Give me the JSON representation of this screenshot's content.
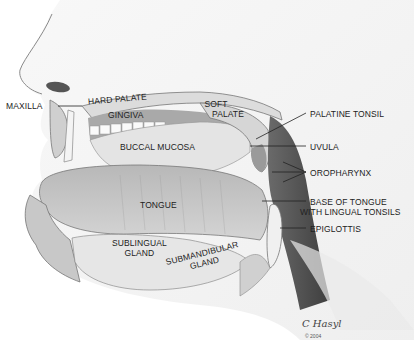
{
  "figure": {
    "labels": [
      {
        "id": "maxilla",
        "text": "MAXILLA"
      },
      {
        "id": "hard-palate",
        "text": "HARD PALATE"
      },
      {
        "id": "gingiva",
        "text": "GINGIVA"
      },
      {
        "id": "soft-palate",
        "text": "SOFT\nPALATE",
        "lines": [
          "SOFT",
          "PALATE"
        ]
      },
      {
        "id": "palatine-tonsil",
        "text": "PALATINE TONSIL"
      },
      {
        "id": "uvula",
        "text": "UVULA"
      },
      {
        "id": "buccal-mucosa",
        "text": "BUCCAL MUCOSA"
      },
      {
        "id": "oropharynx",
        "text": "OROPHARYNX"
      },
      {
        "id": "tongue",
        "text": "TONGUE"
      },
      {
        "id": "base-of-tongue",
        "lines": [
          "BASE OF TONGUE",
          "WITH LINGUAL TONSILS"
        ]
      },
      {
        "id": "epiglottis",
        "text": "EPIGLOTTIS"
      },
      {
        "id": "sublingual-gland",
        "lines": [
          "SUBLINGUAL",
          "GLAND"
        ]
      },
      {
        "id": "submandibular-gland",
        "lines": [
          "SUBMANDIBULAR",
          "GLAND"
        ]
      }
    ],
    "signature": {
      "name": "C Hasyl",
      "copyright": "© 2004"
    }
  }
}
